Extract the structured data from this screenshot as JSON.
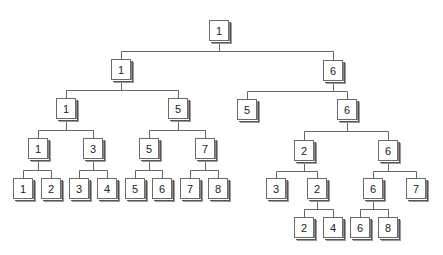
{
  "diagram": {
    "type": "tree",
    "colors": {
      "line": "#666666",
      "box_border": "#6a6a6a",
      "text": "#222222"
    },
    "nodes": [
      {
        "id": "r",
        "label": "1",
        "x": 209,
        "y": 20
      },
      {
        "id": "a",
        "label": "1",
        "x": 111,
        "y": 59,
        "parent": "r"
      },
      {
        "id": "b",
        "label": "6",
        "x": 323,
        "y": 60,
        "parent": "r"
      },
      {
        "id": "aa",
        "label": "1",
        "x": 56,
        "y": 98,
        "parent": "a"
      },
      {
        "id": "ab",
        "label": "5",
        "x": 168,
        "y": 98,
        "parent": "a"
      },
      {
        "id": "ba",
        "label": "5",
        "x": 237,
        "y": 99,
        "parent": "b"
      },
      {
        "id": "bb",
        "label": "6",
        "x": 337,
        "y": 99,
        "parent": "b"
      },
      {
        "id": "aaa",
        "label": "1",
        "x": 28,
        "y": 138,
        "parent": "aa"
      },
      {
        "id": "aab",
        "label": "3",
        "x": 83,
        "y": 138,
        "parent": "aa"
      },
      {
        "id": "aba",
        "label": "5",
        "x": 139,
        "y": 138,
        "parent": "ab"
      },
      {
        "id": "abb",
        "label": "7",
        "x": 195,
        "y": 138,
        "parent": "ab"
      },
      {
        "id": "bba",
        "label": "2",
        "x": 294,
        "y": 140,
        "parent": "bb"
      },
      {
        "id": "bbb",
        "label": "6",
        "x": 378,
        "y": 140,
        "parent": "bb"
      },
      {
        "id": "l1",
        "label": "1",
        "x": 13,
        "y": 178,
        "parent": "aaa"
      },
      {
        "id": "l2",
        "label": "2",
        "x": 41,
        "y": 178,
        "parent": "aaa"
      },
      {
        "id": "l3",
        "label": "3",
        "x": 69,
        "y": 178,
        "parent": "aab"
      },
      {
        "id": "l4",
        "label": "4",
        "x": 97,
        "y": 178,
        "parent": "aab"
      },
      {
        "id": "l5",
        "label": "5",
        "x": 125,
        "y": 178,
        "parent": "aba"
      },
      {
        "id": "l6",
        "label": "6",
        "x": 152,
        "y": 178,
        "parent": "aba"
      },
      {
        "id": "l7",
        "label": "7",
        "x": 180,
        "y": 178,
        "parent": "abb"
      },
      {
        "id": "l8",
        "label": "8",
        "x": 208,
        "y": 178,
        "parent": "abb"
      },
      {
        "id": "bbaa",
        "label": "3",
        "x": 266,
        "y": 178,
        "parent": "bba"
      },
      {
        "id": "bbab",
        "label": "2",
        "x": 307,
        "y": 178,
        "parent": "bba"
      },
      {
        "id": "bbba",
        "label": "6",
        "x": 363,
        "y": 178,
        "parent": "bbb"
      },
      {
        "id": "bbbb",
        "label": "7",
        "x": 406,
        "y": 178,
        "parent": "bbb"
      },
      {
        "id": "m1",
        "label": "2",
        "x": 294,
        "y": 217,
        "parent": "bbab"
      },
      {
        "id": "m2",
        "label": "4",
        "x": 323,
        "y": 217,
        "parent": "bbab"
      },
      {
        "id": "m3",
        "label": "6",
        "x": 350,
        "y": 217,
        "parent": "bbba"
      },
      {
        "id": "m4",
        "label": "8",
        "x": 378,
        "y": 217,
        "parent": "bbba"
      }
    ]
  }
}
